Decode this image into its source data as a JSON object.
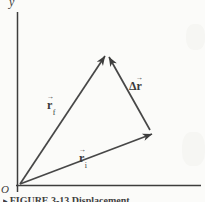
{
  "figure": {
    "axes": {
      "y_label": "y",
      "origin_label": "O"
    },
    "vec_arrow": "→",
    "labels": {
      "r_final": {
        "base": "r",
        "sub": "f"
      },
      "delta_r": {
        "prefix": "Δ",
        "base": "r"
      },
      "r_initial": {
        "base": "r",
        "sub": "i"
      }
    },
    "caption": {
      "marker": "▶",
      "text": "FIGURE 3-13 Displacement"
    },
    "colors": {
      "ink": "#3d3d3d",
      "background": "#fbfbf9"
    }
  }
}
